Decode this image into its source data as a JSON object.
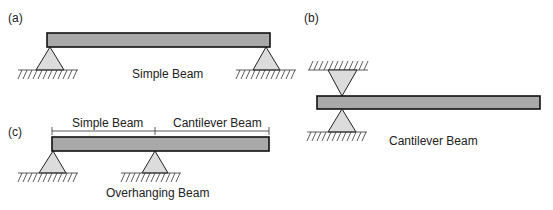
{
  "panels": {
    "a": {
      "tag": "(a)",
      "caption": "Simple Beam"
    },
    "b": {
      "tag": "(b)",
      "caption": "Cantilever Beam"
    },
    "c": {
      "tag": "(c)",
      "caption": "Overhanging Beam",
      "span_left": "Simple Beam",
      "span_right": "Cantilever Beam"
    }
  },
  "colors": {
    "beam_fill": "#a9a9a9",
    "support_fill": "#dcdcdc",
    "stroke": "#111111"
  }
}
